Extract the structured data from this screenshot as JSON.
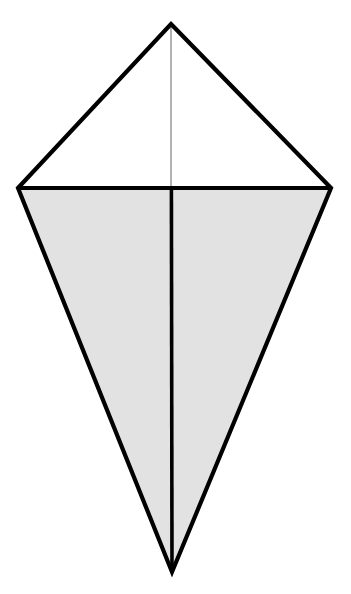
{
  "figure": {
    "name": "kite-quadrilateral-diagram",
    "type": "geometric-diagram",
    "caption": "",
    "canvas": {
      "width": 351,
      "height": 594,
      "background": "#ffffff"
    },
    "colors": {
      "outline": "#000000",
      "lower_region_fill": "#e2e2e2",
      "upper_region_fill": "#ffffff",
      "minor_axis_upper_stroke": "#8a8a8a",
      "minor_axis_lower_stroke": "#000000",
      "major_axis_stroke": "#000000"
    },
    "stroke_widths": {
      "outline": 4.2,
      "horizontal_diagonal": 4.0,
      "vertical_upper": 1.3,
      "vertical_lower": 3.6
    },
    "vertices": [
      {
        "id": "apex",
        "label": "top vertex",
        "x": 171,
        "y": 24
      },
      {
        "id": "left",
        "label": "left vertex",
        "x": 18,
        "y": 188
      },
      {
        "id": "right",
        "label": "right vertex",
        "x": 331,
        "y": 188
      },
      {
        "id": "bottom",
        "label": "bottom vertex",
        "x": 172,
        "y": 572
      }
    ],
    "outline_path": "M 171 24 L 331 188 L 172 572 L 18 188 Z",
    "regions": [
      {
        "id": "upper-triangle",
        "label": "upper white triangle",
        "fill": "#ffffff",
        "path": "M 171 24 L 331 188 L 18 188 Z"
      },
      {
        "id": "lower-triangle",
        "label": "lower shaded triangle",
        "fill": "#e2e2e2",
        "path": "M 18 188 L 331 188 L 172 572 Z"
      }
    ],
    "diagonals": [
      {
        "id": "horizontal-diagonal",
        "label": "horizontal diagonal",
        "x1": 18,
        "y1": 188,
        "x2": 331,
        "y2": 188,
        "stroke": "#000000",
        "width": 4.0
      },
      {
        "id": "vertical-axis-upper",
        "label": "upper axis of symmetry segment",
        "x1": 171,
        "y1": 24,
        "x2": 171,
        "y2": 188,
        "stroke": "#8a8a8a",
        "width": 1.3
      },
      {
        "id": "vertical-axis-lower",
        "label": "lower axis of symmetry segment",
        "x1": 171.5,
        "y1": 188,
        "x2": 172,
        "y2": 572,
        "stroke": "#000000",
        "width": 3.6
      }
    ],
    "intersection_point": {
      "id": "diagonal-intersection",
      "x": 171,
      "y": 188
    }
  }
}
